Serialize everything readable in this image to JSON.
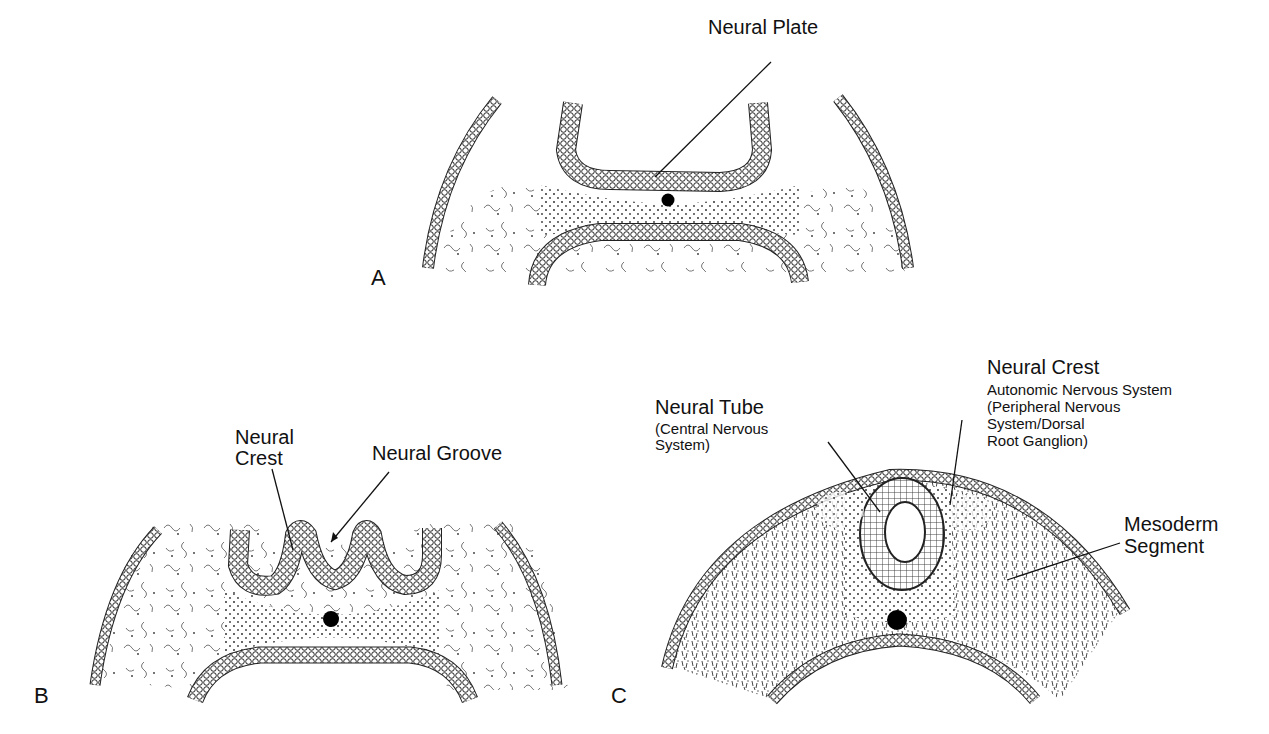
{
  "figure": {
    "panels": [
      {
        "id": "A",
        "letter": "A",
        "labels": {
          "neural_plate": "Neural Plate"
        }
      },
      {
        "id": "B",
        "letter": "B",
        "labels": {
          "neural_crest_1": "Neural",
          "neural_crest_2": "Crest",
          "neural_groove": "Neural Groove"
        }
      },
      {
        "id": "C",
        "letter": "C",
        "labels": {
          "neural_tube": "Neural Tube",
          "neural_tube_sub1": "(Central Nervous",
          "neural_tube_sub2": " System)",
          "neural_crest": "Neural Crest",
          "neural_crest_sub1": "Autonomic Nervous System",
          "neural_crest_sub2": "(Peripheral Nervous",
          "neural_crest_sub3": " System/Dorsal",
          "neural_crest_sub4": " Root Ganglion)",
          "mesoderm_1": "Mesoderm",
          "mesoderm_2": "Segment"
        }
      }
    ]
  }
}
